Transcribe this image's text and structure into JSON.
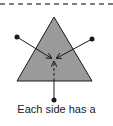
{
  "diagram": {
    "caption": "Each side has a",
    "colors": {
      "triangle_fill": "#9a9a9a",
      "stroke": "#1a1a1a",
      "dashed_line": "#555555"
    },
    "triangle": {
      "apex": [
        54,
        17
      ],
      "base_left": [
        17,
        81
      ],
      "base_right": [
        92,
        81
      ]
    },
    "points": [
      {
        "name": "left-point",
        "pos": [
          17,
          37
        ]
      },
      {
        "name": "right-point",
        "pos": [
          92,
          39
        ]
      },
      {
        "name": "bottom-point",
        "pos": [
          54,
          100
        ]
      }
    ],
    "center_target": [
      54,
      60
    ]
  }
}
